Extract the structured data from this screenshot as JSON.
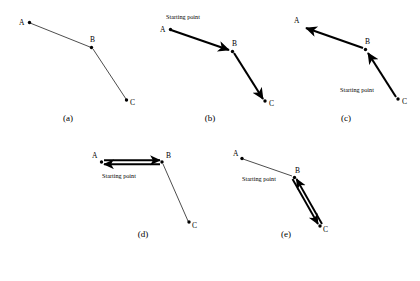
{
  "figure": {
    "background": "#ffffff",
    "stroke_color": "#000000",
    "vertex_labels": [
      "A",
      "B",
      "C"
    ],
    "starting_point_label": "Starting point"
  },
  "panels": [
    {
      "id": "a",
      "caption": "(a)",
      "starting_point_label": "",
      "has_starting_point": false,
      "vertices": {
        "A": {
          "label": "A",
          "x": 14,
          "y": 13
        },
        "B": {
          "label": "B",
          "x": 78,
          "y": 38
        },
        "C": {
          "label": "C",
          "x": 114,
          "y": 93
        }
      },
      "edges": [
        {
          "from": "A",
          "to": "B",
          "weight": "thin",
          "arrow": "none"
        },
        {
          "from": "B",
          "to": "C",
          "weight": "thin",
          "arrow": "none"
        }
      ]
    },
    {
      "id": "b",
      "caption": "(b)",
      "starting_point_label": "Starting point",
      "has_starting_point": true,
      "starting_point_at": "A",
      "vertices": {
        "A": {
          "label": "A",
          "x": 14,
          "y": 21
        },
        "B": {
          "label": "B",
          "x": 78,
          "y": 42
        },
        "C": {
          "label": "C",
          "x": 112,
          "y": 96
        }
      },
      "edges": [
        {
          "from": "A",
          "to": "B",
          "weight": "thick",
          "arrow": "forward"
        },
        {
          "from": "B",
          "to": "C",
          "weight": "thick",
          "arrow": "forward"
        }
      ]
    },
    {
      "id": "c",
      "caption": "(c)",
      "starting_point_label": "Starting point",
      "has_starting_point": true,
      "starting_point_at": "C",
      "vertices": {
        "A": {
          "label": "A",
          "x": 14,
          "y": 18
        },
        "B": {
          "label": "B",
          "x": 78,
          "y": 40
        },
        "C": {
          "label": "C",
          "x": 112,
          "y": 94
        }
      },
      "edges": [
        {
          "from": "C",
          "to": "B",
          "weight": "thick",
          "arrow": "forward"
        },
        {
          "from": "B",
          "to": "A",
          "weight": "thick",
          "arrow": "forward"
        }
      ]
    },
    {
      "id": "d",
      "caption": "(d)",
      "starting_point_label": "Starting point",
      "has_starting_point": true,
      "starting_point_at": "AB-midpoint",
      "vertices": {
        "A": {
          "label": "A",
          "x": 14,
          "y": 13
        },
        "B": {
          "label": "B",
          "x": 78,
          "y": 13
        },
        "C": {
          "label": "C",
          "x": 108,
          "y": 78
        }
      },
      "edges": [
        {
          "from": "A",
          "to": "B",
          "weight": "thick",
          "arrow": "both"
        },
        {
          "from": "B",
          "to": "C",
          "weight": "thin",
          "arrow": "none"
        }
      ]
    },
    {
      "id": "e",
      "caption": "(e)",
      "starting_point_label": "Starting point",
      "has_starting_point": true,
      "starting_point_at": "BC-midpoint",
      "vertices": {
        "A": {
          "label": "A",
          "x": 14,
          "y": 10
        },
        "B": {
          "label": "B",
          "x": 68,
          "y": 28
        },
        "C": {
          "label": "C",
          "x": 96,
          "y": 80
        }
      },
      "edges": [
        {
          "from": "A",
          "to": "B",
          "weight": "thin",
          "arrow": "none"
        },
        {
          "from": "B",
          "to": "C",
          "weight": "thick",
          "arrow": "both"
        }
      ]
    }
  ]
}
